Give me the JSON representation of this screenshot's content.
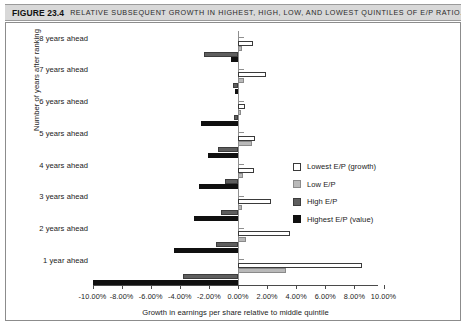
{
  "caption": {
    "figure_number": "FIGURE 23.4",
    "title": "Relative subsequent growth in highest, high, low, and lowest quintiles of E/P ratio."
  },
  "chart_data": {
    "type": "bar",
    "orientation": "horizontal",
    "title": "Relative subsequent growth in highest, high, low, and lowest quintiles of E/P ratio.",
    "xlabel": "Growth in earnings per share relative to middle quintile",
    "ylabel": "Number of years after ranking",
    "xlim": [
      -10,
      10
    ],
    "grid": false,
    "legend_position": "center-right",
    "categories": [
      "8 years ahead",
      "7 years ahead",
      "6 years ahead",
      "5 years ahead",
      "4 years ahead",
      "3 years ahead",
      "2 years ahead",
      "1 year ahead"
    ],
    "xticks": [
      -10,
      -8,
      -6,
      -4,
      -2,
      0,
      2,
      4,
      6,
      8,
      10
    ],
    "xtick_labels": [
      "-10.00%",
      "-8.00%",
      "-6.00%",
      "-4.00%",
      "-2.00%",
      "0.00%",
      "2.00%",
      "4.00%",
      "6.00%",
      "8.00%",
      "10.00%"
    ],
    "series": [
      {
        "name": "Lowest E/P (growth)",
        "color": "#ffffff",
        "values": [
          1.05,
          1.9,
          0.45,
          1.15,
          1.1,
          2.3,
          3.6,
          8.55
        ]
      },
      {
        "name": "Low E/P",
        "color": "#b9b9b9",
        "values": [
          0.25,
          0.4,
          0.2,
          0.95,
          0.35,
          0.3,
          0.55,
          3.3
        ]
      },
      {
        "name": "High E/P",
        "color": "#5e5e5e",
        "values": [
          -2.35,
          -0.35,
          -0.25,
          -1.35,
          -0.9,
          -1.2,
          -1.5,
          -3.8
        ]
      },
      {
        "name": "Highest E/P (value)",
        "color": "#101010",
        "values": [
          -0.45,
          -0.2,
          -2.55,
          -2.05,
          -2.7,
          -3.0,
          -4.4,
          -10.0
        ]
      }
    ]
  }
}
